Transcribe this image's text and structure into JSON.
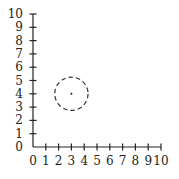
{
  "diagram": {
    "type": "coordinate-plane",
    "x_axis": {
      "min": 0,
      "max": 10,
      "ticks": [
        "0",
        "1",
        "2",
        "3",
        "4",
        "5",
        "6",
        "7",
        "8",
        "9",
        "10"
      ]
    },
    "y_axis": {
      "min": 0,
      "max": 10,
      "ticks": [
        "0",
        "1",
        "2",
        "3",
        "4",
        "5",
        "6",
        "7",
        "8",
        "9",
        "10"
      ]
    },
    "circle": {
      "center": [
        3,
        4
      ],
      "radius": 1.3,
      "style": "dashed",
      "center_marked": true
    },
    "colors": {
      "axis": "#222222",
      "circle": "#333333"
    }
  }
}
